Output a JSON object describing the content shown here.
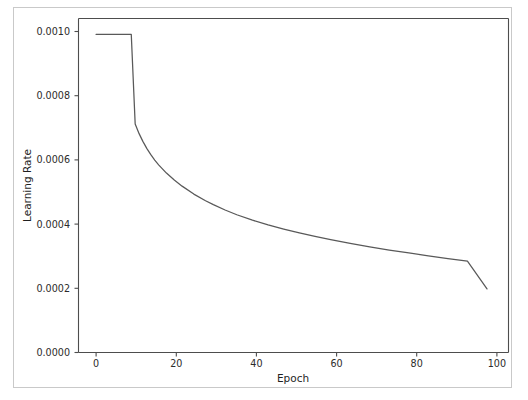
{
  "figure": {
    "background_color": "#ffffff",
    "frame_color": "#c9c9c9",
    "axis_color": "#4d4d4d"
  },
  "chart_data": {
    "type": "line",
    "title": "",
    "xlabel": "Epoch",
    "ylabel": "Learning Rate",
    "xlim": [
      -4.5,
      105.5
    ],
    "ylim": [
      0.0,
      0.00105
    ],
    "grid": false,
    "legend": null,
    "line_color": "#595959",
    "xticks": [
      0,
      20,
      40,
      60,
      80,
      100
    ],
    "xtick_labels": [
      "0",
      "20",
      "40",
      "60",
      "80",
      "100"
    ],
    "yticks": [
      0.0,
      0.0002,
      0.0004,
      0.0006,
      0.0008,
      0.001
    ],
    "ytick_labels": [
      "0.0000",
      "0.0002",
      "0.0004",
      "0.0006",
      "0.0008",
      "0.0010"
    ],
    "series": [
      {
        "name": "learning rate",
        "x": [
          0,
          1,
          2,
          3,
          4,
          5,
          6,
          7,
          8,
          9,
          10,
          11,
          12,
          13,
          14,
          15,
          16,
          18,
          20,
          22,
          25,
          28,
          30,
          33,
          36,
          40,
          44,
          48,
          52,
          56,
          60,
          65,
          70,
          75,
          80,
          85,
          90,
          95,
          100
        ],
        "y": [
          0.001,
          0.001,
          0.001,
          0.001,
          0.001,
          0.001,
          0.001,
          0.001,
          0.001,
          0.001,
          0.000718,
          0.000688,
          0.000663,
          0.000641,
          0.000622,
          0.000605,
          0.00059,
          0.000564,
          0.000542,
          0.000523,
          0.000498,
          0.000477,
          0.000465,
          0.000448,
          0.000433,
          0.000416,
          0.000401,
          0.000388,
          0.000376,
          0.000365,
          0.000355,
          0.000343,
          0.000332,
          0.000322,
          0.000313,
          0.000304,
          0.000295,
          0.000287,
          0.0002
        ]
      }
    ]
  }
}
